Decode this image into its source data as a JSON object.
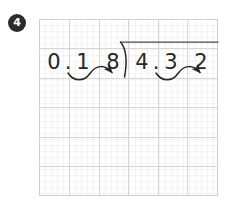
{
  "problem": {
    "number": "4"
  },
  "worksheet": {
    "grid": {
      "columns": 6,
      "rows": 6,
      "line_color": "#d6d6d6"
    }
  },
  "division": {
    "divisor_digits": [
      "0",
      ".",
      "1",
      "8"
    ],
    "divisor_text": "0.18",
    "dividend_digits": [
      "4",
      ".",
      "3",
      "2"
    ],
    "dividend_text": "4.32",
    "bracket_symbol": "long-division-bracket",
    "vinculum": true,
    "annotations": {
      "divisor_arrow_label": "decimal-shift-2-places",
      "dividend_arrow_label": "decimal-shift-2-places"
    },
    "ink_color": "#272727"
  }
}
